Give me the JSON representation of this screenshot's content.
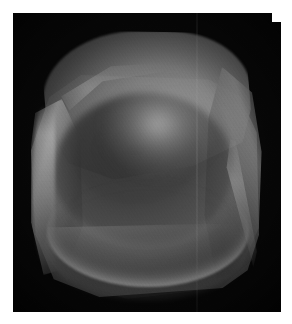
{
  "figure": {
    "kind": "grayscale-3d-render",
    "background_color": "#080808",
    "page_color": "#ffffff",
    "plate": {
      "x": 13,
      "y": 13,
      "width": 268,
      "height": 299
    },
    "canvas": {
      "width": 292,
      "height": 324
    }
  },
  "render": {
    "colorspace": "grayscale",
    "palette": {
      "background": "#080808",
      "shadow": "#1a1a1a",
      "midtone": "#4a4a4a",
      "surface": "#6a6a6a",
      "highlight": "#8a8a8a",
      "specular": "#b4b4b4"
    },
    "lighting": {
      "key_light": "upper-right",
      "specular_spot_x": 160,
      "specular_spot_y": 128
    },
    "artifacts": {
      "grain": "film-grain-speckle",
      "scanline_x": 196
    }
  },
  "geometry": {
    "parts": [
      {
        "id": "top-face",
        "label": "top rim plane"
      },
      {
        "id": "shell-outer",
        "label": "outer shell"
      },
      {
        "id": "arm-left",
        "label": "left arm"
      },
      {
        "id": "arm-right",
        "label": "right arm"
      },
      {
        "id": "seat-well",
        "label": "concave seat well"
      },
      {
        "id": "seat-rim-arc",
        "label": "front seat rim"
      },
      {
        "id": "base-apron",
        "label": "base apron"
      },
      {
        "id": "fold-crease-right",
        "label": "right fold crease"
      }
    ]
  }
}
